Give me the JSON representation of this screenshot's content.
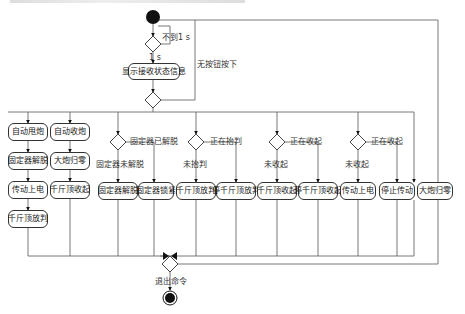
{
  "diagram": {
    "type": "uml-activity",
    "guards": {
      "not_1s": "不到1 s",
      "is_1s": "1 s",
      "no_button": "无按钮按下",
      "fix_not_released": "固定器未解脱",
      "fix_released": "固定器已解脱",
      "not_lifted_1": "未抬判",
      "lifting_1": "正在抬判",
      "not_retracted_1": "未收起",
      "retracting_1": "正在收起",
      "not_retracted_2": "未收起",
      "retracting_2": "正在收起",
      "exit": "退出命令"
    },
    "activities": {
      "show_status": "显示接收状态信息",
      "auto_deploy": "自动甩炮",
      "auto_stow": "自动收炮",
      "col1_release": "固定器解脱",
      "col1_power": "传动上电",
      "col1_jack": "千斤顶放判",
      "col2_zero": "大炮归零",
      "col2_jack": "千斤顶收起",
      "col3_release": "固定器解脱",
      "col4_lock": "固定器锁紧",
      "col5_jack": "千斤顶放判",
      "col6_stop": "停千斤顶放判",
      "col7_jack": "千斤顶收起",
      "col8_stop": "停千斤顶收起",
      "col9_power": "传动上电",
      "col10_stop": "停止传动",
      "col11_zero": "大炮归零"
    },
    "colors": {
      "line": "#555555",
      "node": "#111111",
      "box_border": "#333333"
    }
  }
}
